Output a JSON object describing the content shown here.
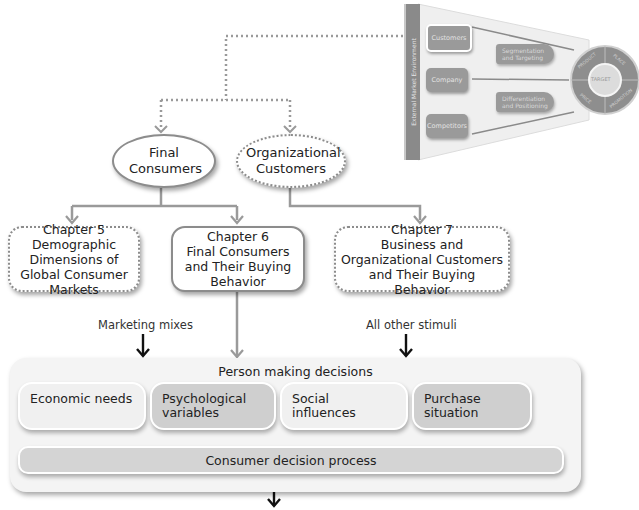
{
  "funnel": {
    "side_label": "External Market Environment",
    "boxes": [
      "Customers",
      "Company",
      "Competitors"
    ],
    "middle_labels": [
      "Segmentation and Targeting",
      "Differentiation and Positioning"
    ],
    "circle": {
      "center": "TARGET",
      "segments": [
        "PRODUCT",
        "PLACE",
        "PROMOTION",
        "PRICE"
      ]
    }
  },
  "ovals": {
    "final_consumers": "Final Consumers",
    "organizational_customers": "Organizational Customers"
  },
  "chapters": [
    {
      "title": "Chapter 5",
      "body": "Demographic Dimensions of Global Consumer Markets",
      "style": "dotted"
    },
    {
      "title": "Chapter 6",
      "body": "Final Consumers and Their Buying Behavior",
      "style": "solid"
    },
    {
      "title": "Chapter 7",
      "body": "Business and Organizational Customers and Their Buying Behavior",
      "style": "dotted"
    }
  ],
  "stimuli": {
    "left": "Marketing mixes",
    "right": "All other stimuli"
  },
  "decision_model": {
    "title": "Person making decisions",
    "factors": [
      "Economic needs",
      "Psychological variables",
      "Social influences",
      "Purchase situation"
    ],
    "process": "Consumer decision process"
  },
  "colors": {
    "line_gray": "#9a9a9a",
    "border_gray": "#8c8c8c",
    "highlight_box": "#cfcfcf",
    "light_box": "#f0f0f0",
    "arrow_black": "#111111"
  }
}
